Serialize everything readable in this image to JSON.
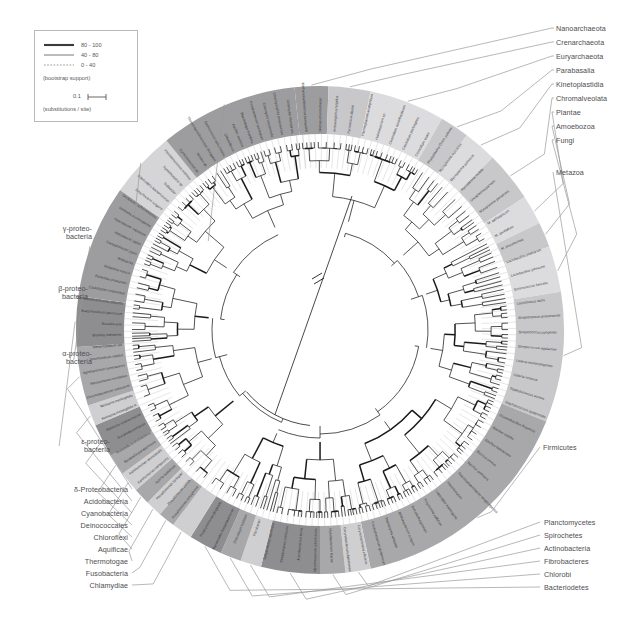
{
  "figure": {
    "kind": "circular-phylogenetic-tree",
    "background": "#ffffff",
    "line_color": "#1a1a1a",
    "label_color": "#58585a"
  },
  "legend": {
    "bootstrap_caption": "(bootstrap support)",
    "scale_caption": "(substitutions / site)",
    "scale_value": "0.1",
    "rows": [
      {
        "label": "80 - 100",
        "style": "thick"
      },
      {
        "label": "40 - 80",
        "style": "thin"
      },
      {
        "label": "0 - 40",
        "style": "dotted"
      }
    ]
  },
  "groups_right_top": [
    {
      "label": "Nanoarchaeota"
    },
    {
      "label": "Crenarchaeota"
    },
    {
      "label": "Euryarchaeota"
    },
    {
      "label": "Parabasalia"
    },
    {
      "label": "Kinetoplastidia"
    },
    {
      "label": "Chromalveolata"
    },
    {
      "label": "Plantae"
    },
    {
      "label": "Amoebozoa"
    },
    {
      "label": "Fungi"
    }
  ],
  "groups_right_mid": [
    {
      "label": "Metazoa"
    }
  ],
  "groups_right_lower": [
    {
      "label": "Firmicutes"
    }
  ],
  "groups_right_bottom": [
    {
      "label": "Planctomycetes"
    },
    {
      "label": "Spirochetes"
    },
    {
      "label": "Actinobacteria"
    },
    {
      "label": "Fibrobacteres"
    },
    {
      "label": "Chlorobi"
    },
    {
      "label": "Bacteriodetes"
    }
  ],
  "groups_left_mid": [
    {
      "label_lines": [
        "γ-proteo-",
        "bacteria"
      ]
    },
    {
      "label_lines": [
        "β-proteo-",
        "bacteria"
      ]
    },
    {
      "label_lines": [
        "α-proteo-",
        "bacteria"
      ]
    },
    {
      "label_lines": [
        "ε-proteo-",
        "bacteria"
      ]
    }
  ],
  "groups_left_bottom": [
    {
      "label": "δ-Proteobacteria"
    },
    {
      "label": "Acidobacteria"
    },
    {
      "label": "Cyanobacteria"
    },
    {
      "label": "Deinococcales"
    },
    {
      "label": "Chloroflexi"
    },
    {
      "label": "Aquificae"
    },
    {
      "label": "Thermotogae"
    },
    {
      "label": "Fusobacteria"
    },
    {
      "label": "Chlamydiae"
    }
  ],
  "ring_bands": [
    {
      "name": "nanoarchaeota-band",
      "start_deg": -96,
      "end_deg": -88,
      "fill": "#9d9d9f"
    },
    {
      "name": "crenarchaeota-band",
      "start_deg": -88,
      "end_deg": -78,
      "fill": "#c8c8ca"
    },
    {
      "name": "euryarchaeota-band",
      "start_deg": -78,
      "end_deg": -60,
      "fill": "#dcdcde"
    },
    {
      "name": "parabasalia-band",
      "start_deg": -60,
      "end_deg": -53,
      "fill": "#c8c8ca"
    },
    {
      "name": "kinetoplastidia-band",
      "start_deg": -53,
      "end_deg": -45,
      "fill": "#dcdcde"
    },
    {
      "name": "chromalveolata-band",
      "start_deg": -45,
      "end_deg": -33,
      "fill": "#c8c8ca"
    },
    {
      "name": "plantae-band",
      "start_deg": -33,
      "end_deg": -26,
      "fill": "#dcdcde"
    },
    {
      "name": "amoebozoa-band",
      "start_deg": -26,
      "end_deg": -20,
      "fill": "#c8c8ca"
    },
    {
      "name": "fungi-band",
      "start_deg": -20,
      "end_deg": -9,
      "fill": "#dcdcde"
    },
    {
      "name": "metazoa-band",
      "start_deg": -9,
      "end_deg": 22,
      "fill": "#c8c8ca"
    },
    {
      "name": "firmicutes-band",
      "start_deg": 22,
      "end_deg": 78,
      "fill": "#a8a8aa"
    },
    {
      "name": "planctomycetes-band",
      "start_deg": 78,
      "end_deg": 84,
      "fill": "#cfcfd1"
    },
    {
      "name": "spirochetes-band",
      "start_deg": 84,
      "end_deg": 90,
      "fill": "#a8a8aa"
    },
    {
      "name": "actinobacteria-band",
      "start_deg": 90,
      "end_deg": 104,
      "fill": "#8e8e90"
    },
    {
      "name": "fibrobacteres-band",
      "start_deg": 104,
      "end_deg": 109,
      "fill": "#cfcfd1"
    },
    {
      "name": "chlorobi-band",
      "start_deg": 109,
      "end_deg": 114,
      "fill": "#a8a8aa"
    },
    {
      "name": "bacteriodetes-band",
      "start_deg": 114,
      "end_deg": 122,
      "fill": "#8e8e90"
    },
    {
      "name": "chlamydiae-band",
      "start_deg": 122,
      "end_deg": 127,
      "fill": "#cfcfd1"
    },
    {
      "name": "fusobacteria-band",
      "start_deg": 127,
      "end_deg": 131,
      "fill": "#a8a8aa"
    },
    {
      "name": "thermotogae-band",
      "start_deg": 131,
      "end_deg": 135,
      "fill": "#cfcfd1"
    },
    {
      "name": "aquificae-band",
      "start_deg": 135,
      "end_deg": 139,
      "fill": "#a8a8aa"
    },
    {
      "name": "chloroflexi-band",
      "start_deg": 139,
      "end_deg": 144,
      "fill": "#cfcfd1"
    },
    {
      "name": "deinococcales-band",
      "start_deg": 144,
      "end_deg": 149,
      "fill": "#a8a8aa"
    },
    {
      "name": "cyanobacteria-band",
      "start_deg": 149,
      "end_deg": 157,
      "fill": "#8e8e90"
    },
    {
      "name": "acidobacteria-band",
      "start_deg": 157,
      "end_deg": 162,
      "fill": "#cfcfd1"
    },
    {
      "name": "delta-proteo-band",
      "start_deg": 162,
      "end_deg": 176,
      "fill": "#a8a8aa"
    },
    {
      "name": "epsilon-proteo-band",
      "start_deg": 176,
      "end_deg": 188,
      "fill": "#8e8e90"
    },
    {
      "name": "alpha-proteo-band",
      "start_deg": 188,
      "end_deg": 215,
      "fill": "#9d9d9f"
    },
    {
      "name": "beta-proteo-band",
      "start_deg": 215,
      "end_deg": 231,
      "fill": "#d5d5d7"
    },
    {
      "name": "gamma-proteo-band",
      "start_deg": 231,
      "end_deg": 264,
      "fill": "#9d9d9f"
    }
  ],
  "taxa_right": [
    "Methanocaldococcus jannaschii",
    "Methanothermobacter",
    "Archaeoglobus fulgidus",
    "Pyrococcus abyssi",
    "Thermoplasma acidophilum",
    "Halobacterium sp.",
    "Clostridium acetobutylicum",
    "Clostridium perfringens",
    "Clostridium tetani",
    "Phytoplasma Onion yellows",
    "Mycoplasma mycoides",
    "Mycoplasma pulmonis",
    "Mycoplasma mobile",
    "Ureaplasma parvum",
    "Mycoplasma penetrans",
    "M. gallisepticum",
    "M. genitalium",
    "M. pneumoniae",
    "Lactobacillus plantarum",
    "Lactobacillus johnsonii",
    "Enterococcus faecalis",
    "Lactococcus lactis",
    "Streptococcus pneumoniae",
    "Streptococcus pyogenes",
    "Streptococcus agalactiae",
    "Listeria monocytogenes",
    "Listeria innocua",
    "Staphylococcus aureus",
    "Staphylococcus epidermidis",
    "Oceanobacillus iheyensis",
    "Bacillus subtilis",
    "Bacillus halodurans",
    "Bacillus cereus",
    "Bacillus anthracis",
    "Thermoanaerobacter tengcongensis",
    "Planctomyces",
    "Leptospira interrogans",
    "Treponema pallidum",
    "Borrelia burgdorferi",
    "Bifidobacterium longum",
    "Tropheryma whipplei",
    "Corynebacterium glutamicum",
    "Corynebacterium efficiens",
    "Corynebacterium diphtheriae",
    "Mycobacterium leprae",
    "Mycobacterium tuberculosis",
    "Mycobacterium bovis",
    "Streptomyces coelicolor",
    "Streptomyces avermitilis",
    "Fibrobacter",
    "Chlorobium tepidum",
    "Bacteroides thetaiotaomicron",
    "Porphyromonas gingivalis"
  ],
  "taxa_left": [
    "Pseudomonas aeruginosa",
    "Pseudomonas putida",
    "Pseudomonas syringae",
    "Xylella fastidiosa",
    "Xanthomonas campestris",
    "Xanthomonas axonopodis",
    "Bordetella parapertussis",
    "Bordetella bronchiseptica",
    "Bordetella pertussis",
    "Ralstonia solanacearum",
    "Neisseria meningitidis A",
    "Neisseria meningitidis",
    "Chromobacterium violaceum",
    "Nitrosomonas europaea",
    "Agrobacterium tumefaciens",
    "Sinorhizobium meliloti",
    "Mesorhizobium loti",
    "Brucella melitensis",
    "Brucella suis",
    "Bradyrhizobium japonicum",
    "Rhodopseudomonas palustris",
    "Caulobacter crescentus",
    "Rickettsia prowazekii",
    "Rickettsia conorii",
    "Wolbachia",
    "Campylobacter jejuni",
    "Helicobacter pylori",
    "Helicobacter hepaticus",
    "Wolinella succinogenes",
    "Geobacter sulfurreducens",
    "Desulfovibrio vulgaris",
    "Bdellovibrio bacteriovorus",
    "Solibacter",
    "Synechocystis sp.",
    "Prochlorococcus marinus",
    "Synechococcus sp.",
    "Nostoc sp.",
    "Thermosynechococcus elongatus",
    "Deinococcus radiodurans",
    "Chloroflexus",
    "Aquifex aeolicus",
    "Thermotoga maritima",
    "Fusobacterium nucleatum",
    "Chlamydia trachomatis",
    "Chlamydophila pneumoniae",
    "Chlamydia muridarum"
  ]
}
